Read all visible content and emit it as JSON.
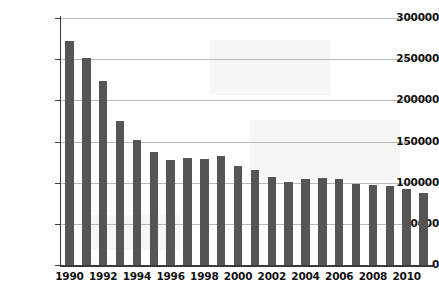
{
  "chart_data": {
    "type": "bar",
    "title": "",
    "subtitle": "",
    "xlabel": "",
    "ylabel": "",
    "categories": [
      "1990",
      "1991",
      "1992",
      "1993",
      "1994",
      "1995",
      "1996",
      "1997",
      "1998",
      "1999",
      "2000",
      "2001",
      "2002",
      "2003",
      "2004",
      "2005",
      "2006",
      "2007",
      "2008",
      "2009",
      "2010",
      "2011"
    ],
    "values": [
      272000,
      251000,
      224000,
      175000,
      152000,
      137000,
      128000,
      130000,
      129000,
      133000,
      120000,
      116000,
      107000,
      101000,
      105000,
      106000,
      104000,
      98000,
      97000,
      96000,
      92000,
      87000
    ],
    "ylim": [
      0,
      300000
    ],
    "xlim_labels_every": 2,
    "ytick_values": [
      0,
      50000,
      100000,
      150000,
      200000,
      250000,
      300000
    ],
    "ytick_labels": [
      "0",
      "50000",
      "100000",
      "150000",
      "200000",
      "250000",
      "300000"
    ],
    "xtick_labels": [
      "1990",
      "1992",
      "1994",
      "1996",
      "1998",
      "2000",
      "2002",
      "2004",
      "2006",
      "2008",
      "2010"
    ],
    "grid": true,
    "grid_axis": "y",
    "legend": false,
    "legend_position": "none",
    "bar_color": "#555555",
    "gridline_color": "#b9b9b9",
    "axis_color": "#3a3a3a",
    "background_color": "#ffffff",
    "text_color": "#111111"
  }
}
